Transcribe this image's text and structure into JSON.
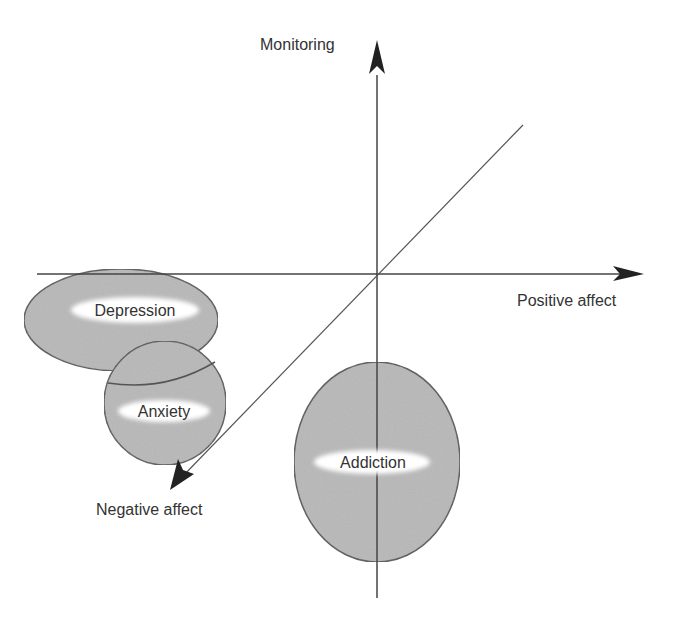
{
  "diagram": {
    "axes": {
      "vertical": {
        "label": "Monitoring"
      },
      "horizontal": {
        "label": "Positive affect"
      },
      "diagonal": {
        "label": "Negative affect"
      }
    },
    "regions": [
      {
        "id": "depression",
        "label": "Depression"
      },
      {
        "id": "anxiety",
        "label": "Anxiety"
      },
      {
        "id": "addiction",
        "label": "Addiction"
      }
    ],
    "colors": {
      "region_fill": "#b8b8b8",
      "region_stroke": "#555555",
      "axis": "#444444",
      "label_bg": "#ffffff",
      "text": "#333333"
    }
  }
}
